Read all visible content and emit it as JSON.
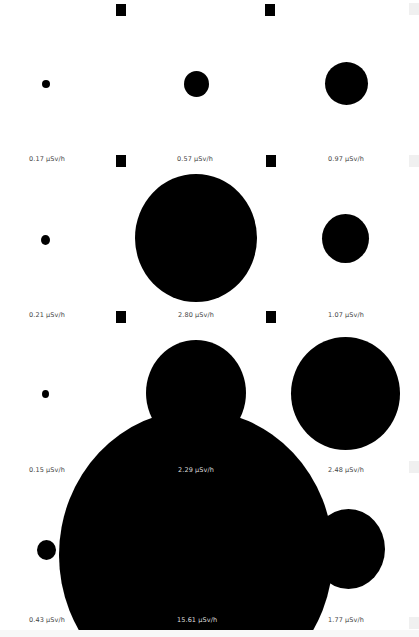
{
  "unit": "µSv/h",
  "cells": [
    {
      "row": 0,
      "col": 0,
      "label": "0.17 µSv/h",
      "value": 0.17
    },
    {
      "row": 0,
      "col": 1,
      "label": "0.57 µSv/h",
      "value": 0.57
    },
    {
      "row": 0,
      "col": 2,
      "label": "0.97 µSv/h",
      "value": 0.97
    },
    {
      "row": 1,
      "col": 0,
      "label": "0.21 µSv/h",
      "value": 0.21
    },
    {
      "row": 1,
      "col": 1,
      "label": "2.80 µSv/h",
      "value": 2.8
    },
    {
      "row": 1,
      "col": 2,
      "label": "1.07 µSv/h",
      "value": 1.07
    },
    {
      "row": 2,
      "col": 0,
      "label": "0.15 µSv/h",
      "value": 0.15
    },
    {
      "row": 2,
      "col": 1,
      "label": "2.29 µSv/h",
      "value": 2.29
    },
    {
      "row": 2,
      "col": 2,
      "label": "2.48 µSv/h",
      "value": 2.48
    },
    {
      "row": 3,
      "col": 0,
      "label": "0.43 µSv/h",
      "value": 0.43
    },
    {
      "row": 3,
      "col": 1,
      "label": "15.61 µSv/h",
      "value": 15.61
    },
    {
      "row": 3,
      "col": 2,
      "label": "1.77 µSv/h",
      "value": 1.77
    }
  ],
  "colors": {
    "circle": "#000000",
    "background": "#ffffff",
    "label": "#444444"
  }
}
